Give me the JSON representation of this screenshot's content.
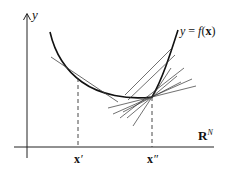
{
  "diagram": {
    "type": "convex-function-subgradients",
    "labels": {
      "y_axis": "y",
      "function": "y = f(x)",
      "function_parts": {
        "y": "y",
        "eq": " = ",
        "f": "f",
        "open": "(",
        "x": "x",
        "close": ")"
      },
      "space": "R",
      "space_sup": "N",
      "x_prime": "x",
      "x_prime_mark": "′",
      "x_double_prime": "x",
      "x_double_prime_mark": "″"
    },
    "colors": {
      "stroke": "#111111",
      "thin_stroke": "#333333",
      "background": "#ffffff"
    },
    "points": {
      "x_prime": {
        "x": 78,
        "y": 78
      },
      "x_double_prime": {
        "x": 152,
        "y": 97
      }
    },
    "tangent_count_at_x_prime": 1,
    "subgradient_count_at_x_double_prime": 8
  }
}
